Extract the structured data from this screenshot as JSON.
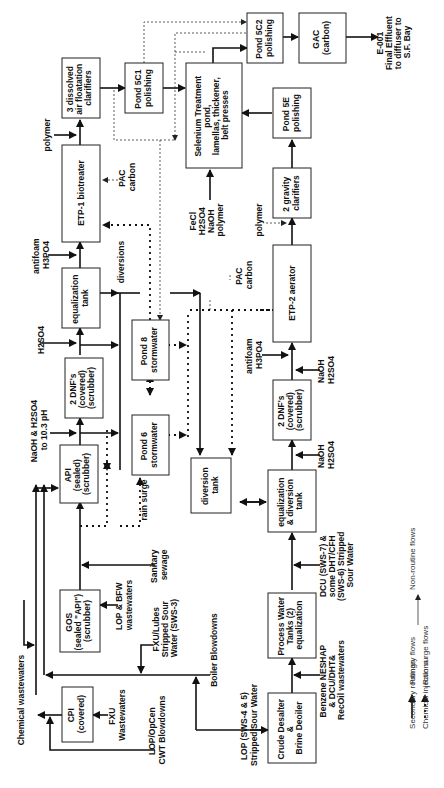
{
  "diagram": {
    "orientation": "rotated 90 degrees clockwise (text reads bottom-to-top)",
    "nodes": {
      "daf": [
        "3 dissolved",
        "air floatation",
        "clarifiers"
      ],
      "pond5c1": [
        "Pond 5C1",
        "polishing"
      ],
      "selenium": [
        "Selenium Treatment",
        "pond,",
        "lamellas, thickener,",
        "belt presses"
      ],
      "pond5c2": [
        "Pond 5C2",
        "polishing"
      ],
      "gac": [
        "GAC",
        "(carbon)"
      ],
      "pond5e": [
        "Pond 5E",
        "polishing"
      ],
      "gravity": [
        "2 gravity",
        "clarifiers"
      ],
      "etp1": [
        "ETP-1 biotreater"
      ],
      "etp2": [
        "ETP-2 aerator"
      ],
      "eqtank": [
        "equalization",
        "tank"
      ],
      "dnf1": [
        "2 DNF's",
        "(covered)",
        "(scrubber)"
      ],
      "dnf2": [
        "2 DNF's",
        "(covered)",
        "(scrubber)"
      ],
      "pond8": [
        "Pond 8",
        "stormwater"
      ],
      "pond6": [
        "Pond 6",
        "stormwater"
      ],
      "api": [
        "API",
        "(sealed)",
        "(scrubber)"
      ],
      "diversion": [
        "diversion",
        "tank"
      ],
      "eqdiv": [
        "equalization",
        "& diversion",
        "tank"
      ],
      "gos": [
        "GOS",
        "(sealed \"API\")",
        "(scrubber)"
      ],
      "pwt": [
        "Process Water",
        "Tanks (2)",
        "equalization"
      ],
      "cpi": [
        "CPI",
        "(covered)"
      ],
      "desalter": [
        "Crude Desalter",
        "&",
        "Brine Deoiler"
      ]
    },
    "labels": {
      "effluent": [
        "E-001",
        "Final Effluent",
        "to diffuser to",
        "S.F. Bay"
      ],
      "polymer1": [
        "polymer"
      ],
      "pac1": [
        "PAC",
        "carbon"
      ],
      "fecl": [
        "FeCl",
        "H2SO4",
        "NaOH",
        "polymer"
      ],
      "polymer2": [
        "polymer"
      ],
      "pac2": [
        "PAC",
        "carbon"
      ],
      "antifoam1": [
        "antifoam",
        "H3PO4"
      ],
      "diversions": [
        "diversions"
      ],
      "h2so4": [
        "H2SO4"
      ],
      "antifoam2": [
        "antifoam",
        "H3PO4"
      ],
      "naoh1": [
        "NaOH",
        "H2SO4"
      ],
      "naoh2": [
        "NaOH & H2SO4",
        "to 10.3 pH"
      ],
      "naoh3": [
        "NaOH",
        "H2SO4"
      ],
      "rainsurge": [
        "rain surge"
      ],
      "sanitary": [
        "Sanitary",
        "sewage"
      ],
      "lopbfw": [
        "LOP & BFW",
        "wastewaters"
      ],
      "fxulubes": [
        "FXU/Lubes",
        "Stripped Sour",
        "Water (SWS-3)"
      ],
      "dcu": [
        "DCU (SWS-7) &",
        "some DHT/CFH",
        "(SWS-6) Stripped",
        "Sour Water"
      ],
      "boiler": [
        "Boiler  Blowdowns"
      ],
      "chemical": [
        "Chemical wastewaters"
      ],
      "fxuww": [
        "FXU",
        "Wastewaters"
      ],
      "lopopcen": [
        "LOP/OpCen",
        "CWT Blowdowns"
      ],
      "lopsws": [
        "LOP  (SWS-4 & 5)",
        "Stripped Sour Water"
      ],
      "benzene": [
        "Benzene NESHAP",
        "& DCU/DHT&",
        "RecOil wastewaters"
      ]
    },
    "legend": {
      "primary": "Primary flows",
      "rain": "Rain surge flows",
      "secondary": "Secondary routings",
      "nonroutine": "Non-routine flows",
      "chemical": "Chemical injections"
    }
  }
}
